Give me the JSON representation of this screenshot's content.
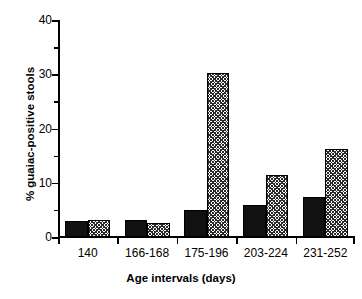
{
  "chart_data": {
    "type": "bar",
    "title": "",
    "xlabel": "Age intervals (days)",
    "ylabel": "% guaiac-positive stools",
    "categories": [
      "140",
      "166-168",
      "175-196",
      "203-224",
      "231-252"
    ],
    "series": [
      {
        "name": "solid",
        "values": [
          3.0,
          3.2,
          4.9,
          5.9,
          7.3
        ]
      },
      {
        "name": "hatched",
        "values": [
          3.2,
          2.6,
          30.2,
          11.5,
          16.2
        ]
      }
    ],
    "ylim": [
      0,
      40
    ],
    "yticks": [
      0,
      10,
      20,
      30,
      40
    ],
    "ytick_labels": [
      "0",
      "10",
      "20",
      "30",
      "40"
    ],
    "yminor_ticks": [
      5,
      15,
      25,
      35
    ],
    "grid": false,
    "legend": "none"
  },
  "axes": {
    "y_title": "% guaiac-positive stools",
    "x_title": "Age intervals (days)"
  },
  "colors": {
    "solid_bar": "#111111",
    "hatch_bar": "#2a2a2a",
    "axis": "#000000",
    "background": "#ffffff"
  }
}
